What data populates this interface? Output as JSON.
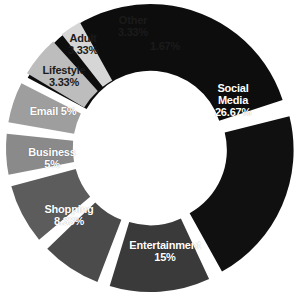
{
  "chart_data": {
    "type": "pie",
    "variant": "exploded-donut",
    "title": "",
    "subtitle": "",
    "xlabel": "",
    "ylabel": "",
    "legend": "none",
    "grid": false,
    "value_unit": "%",
    "hole_ratio": 0.52,
    "categories": [
      "Social Media",
      "Entertainment",
      "Shopping",
      "Business",
      "Email",
      "Lifestyle",
      "Adult",
      "Other",
      ""
    ],
    "values": [
      26.67,
      15,
      8.33,
      5,
      5,
      3.33,
      3.33,
      3.33,
      1.67
    ],
    "value_labels": [
      "26.67%",
      "15%",
      "8.33%",
      "5%",
      "5%",
      "3.33%",
      "3.33%",
      "3.33%",
      "1.67%"
    ],
    "colors": [
      "#0d0d0d",
      "#101010",
      "#3a3a3a",
      "#4b4b4b",
      "#5c5c5c",
      "#8a8a8a",
      "#9e9e9e",
      "#bdbdbd",
      "#d6d6d6"
    ],
    "slices": [
      {
        "label": "Social Media",
        "value": 26.67,
        "value_label": "26.67%",
        "color": "#0d0d0d",
        "label_color": "light",
        "start_angle": -62,
        "end_angle": 72,
        "exploded": true
      },
      {
        "label": "Entertainment",
        "value": 15,
        "value_label": "15%",
        "color": "#101010",
        "label_color": "light",
        "start_angle": 76,
        "end_angle": 151,
        "exploded": true
      },
      {
        "label": "Shopping",
        "value": 8.33,
        "value_label": "8.33%",
        "color": "#3a3a3a",
        "label_color": "light",
        "start_angle": 155,
        "end_angle": 197,
        "exploded": true
      },
      {
        "label": "Business",
        "value": 5,
        "value_label": "5%",
        "color": "#4b4b4b",
        "label_color": "light",
        "start_angle": 201,
        "end_angle": 226,
        "exploded": true
      },
      {
        "label": "Email",
        "value": 5,
        "value_label": "5%",
        "color": "#5c5c5c",
        "label_color": "light",
        "start_angle": 230,
        "end_angle": 255,
        "exploded": true
      },
      {
        "label": "Lifestyle",
        "value": 3.33,
        "value_label": "3.33%",
        "color": "#8a8a8a",
        "label_color": "dark",
        "start_angle": 259,
        "end_angle": 276,
        "exploded": true
      },
      {
        "label": "Adult",
        "value": 3.33,
        "value_label": "3.33%",
        "color": "#9e9e9e",
        "label_color": "dark",
        "start_angle": 280,
        "end_angle": 297,
        "exploded": true
      },
      {
        "label": "Other",
        "value": 3.33,
        "value_label": "3.33%",
        "color": "#bdbdbd",
        "label_color": "dark",
        "start_angle": 301,
        "end_angle": 318,
        "exploded": true
      },
      {
        "label": "",
        "value": 1.67,
        "value_label": "1.67%",
        "color": "#d6d6d6",
        "label_color": "dark",
        "start_angle": 322,
        "end_angle": 331,
        "exploded": true
      }
    ]
  },
  "labels": {
    "social_media": {
      "name": "Social",
      "name2": "Media",
      "value": "26.67%"
    },
    "entertainment": {
      "name": "Entertainment",
      "value": "15%"
    },
    "shopping": {
      "name": "Shopping",
      "value": "8.33%"
    },
    "business": {
      "name": "Business",
      "value": "5%"
    },
    "email": {
      "name": "Email",
      "value": "5%"
    },
    "lifestyle": {
      "name": "Lifestyle",
      "value": "3.33%"
    },
    "adult": {
      "name": "Adult",
      "value": "3.33%"
    },
    "other": {
      "name": "Other",
      "value": "3.33%"
    },
    "unlabeled": {
      "name": "",
      "value": "1.67%"
    }
  }
}
